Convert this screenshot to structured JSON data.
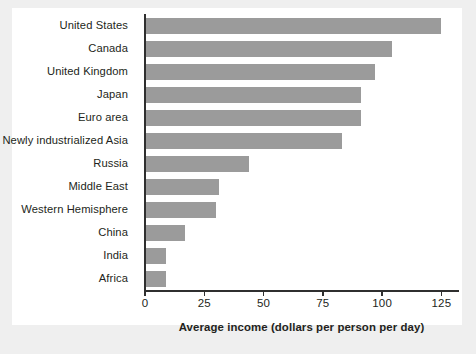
{
  "chart_data": {
    "type": "bar",
    "orientation": "horizontal",
    "title": "",
    "xlabel": "Average income (dollars per person per day)",
    "ylabel": "",
    "xlim": [
      0,
      132
    ],
    "xticks": [
      0,
      25,
      50,
      75,
      100,
      125
    ],
    "xtick_labels": [
      "0",
      "25",
      "50",
      "75",
      "100",
      "125"
    ],
    "grid": false,
    "legend": null,
    "bar_color": "#9b9b9b",
    "axis_color": "#2f2f2f",
    "text_color": "#231f20",
    "plot_background": "#ffffff",
    "figure_background": "#efefef",
    "categories": [
      "United States",
      "Canada",
      "United Kingdom",
      "Japan",
      "Euro area",
      "Newly industrialized Asia",
      "Russia",
      "Middle East",
      "Western Hemisphere",
      "China",
      "India",
      "Africa"
    ],
    "values": [
      125,
      104,
      97,
      91,
      91,
      83,
      44,
      31,
      30,
      17,
      9,
      9
    ]
  }
}
